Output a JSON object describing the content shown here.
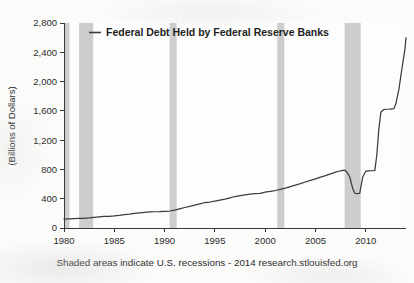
{
  "chart_data": {
    "type": "line",
    "title": "",
    "xlabel": "",
    "ylabel": "(Billions of Dollars)",
    "xlim": [
      1980,
      2014
    ],
    "ylim": [
      0,
      2800
    ],
    "grid": false,
    "legend_position": "top-left-inside",
    "series": [
      {
        "name": "Federal Debt Held by Federal Reserve Banks",
        "color": "#3c3c3c",
        "x": [
          1980.0,
          1980.5,
          1981.0,
          1981.5,
          1982.0,
          1982.5,
          1983.0,
          1983.5,
          1984.0,
          1984.5,
          1985.0,
          1985.5,
          1986.0,
          1986.5,
          1987.0,
          1987.5,
          1988.0,
          1988.5,
          1989.0,
          1989.5,
          1990.0,
          1990.5,
          1991.0,
          1991.5,
          1992.0,
          1992.5,
          1993.0,
          1993.5,
          1994.0,
          1994.5,
          1995.0,
          1995.5,
          1996.0,
          1996.5,
          1997.0,
          1997.5,
          1998.0,
          1998.5,
          1999.0,
          1999.5,
          2000.0,
          2000.5,
          2001.0,
          2001.5,
          2002.0,
          2002.5,
          2003.0,
          2003.5,
          2004.0,
          2004.5,
          2005.0,
          2005.5,
          2006.0,
          2006.5,
          2007.0,
          2007.3,
          2007.6,
          2007.9,
          2008.1,
          2008.4,
          2008.7,
          2008.9,
          2009.1,
          2009.4,
          2009.7,
          2010.0,
          2010.3,
          2010.6,
          2010.9,
          2011.1,
          2011.3,
          2011.5,
          2011.8,
          2012.0,
          2012.4,
          2012.8,
          2013.0,
          2013.3,
          2013.6,
          2013.9,
          2014.0
        ],
        "y": [
          121,
          124,
          128,
          130,
          133,
          137,
          145,
          152,
          158,
          160,
          165,
          172,
          182,
          190,
          200,
          208,
          215,
          220,
          222,
          224,
          228,
          232,
          245,
          262,
          280,
          295,
          312,
          330,
          348,
          355,
          368,
          382,
          395,
          412,
          430,
          442,
          452,
          462,
          470,
          472,
          490,
          500,
          512,
          528,
          545,
          565,
          585,
          605,
          628,
          650,
          672,
          695,
          715,
          740,
          762,
          775,
          785,
          790,
          770,
          700,
          540,
          478,
          468,
          472,
          700,
          776,
          780,
          782,
          786,
          1000,
          1350,
          1580,
          1618,
          1622,
          1625,
          1630,
          1700,
          1900,
          2180,
          2450,
          2600
        ],
        "values_note": "Billions of dollars; dip during 2008-09 crisis then QE-driven rise"
      }
    ],
    "y_ticks": [
      0,
      400,
      800,
      1200,
      1600,
      2000,
      2400,
      2800
    ],
    "y_tick_labels": [
      "0",
      "400",
      "800",
      "1,200",
      "1,600",
      "2,000",
      "2,400",
      "2,800"
    ],
    "x_ticks": [
      1980,
      1985,
      1990,
      1995,
      2000,
      2005,
      2010
    ],
    "x_tick_labels": [
      "1980",
      "1985",
      "1990",
      "1995",
      "2000",
      "2005",
      "2010"
    ],
    "recessions": [
      {
        "label": "1980 recession",
        "start": 1980.0,
        "end": 1980.55
      },
      {
        "label": "1981-1982 recession",
        "start": 1981.5,
        "end": 1982.9
      },
      {
        "label": "1990-1991 recession",
        "start": 1990.5,
        "end": 1991.2
      },
      {
        "label": "2001 recession",
        "start": 2001.2,
        "end": 2001.9
      },
      {
        "label": "2007-2009 recession",
        "start": 2007.9,
        "end": 2009.5
      }
    ],
    "recession_band_color": "#c9c9c9",
    "annotations": []
  },
  "legend": {
    "entries": [
      {
        "label": "Federal Debt  Held by Federal Reserve Banks",
        "marker": "line-swatch"
      }
    ]
  },
  "footer": {
    "note": "Shaded areas indicate U.S. recessions - 2014 research.stlouisfed.org"
  },
  "axes": {
    "y_title": "(Billions of Dollars)"
  }
}
